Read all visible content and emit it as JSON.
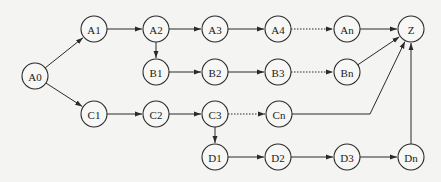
{
  "diagram": {
    "type": "directed-graph",
    "node_radius": 13,
    "colors": {
      "stroke": "#2a2a2a",
      "fill": "#f7f7f5",
      "background": "#f4f4f2"
    },
    "nodes": [
      {
        "id": "A0",
        "label": "A0",
        "x": 35,
        "y": 76
      },
      {
        "id": "A1",
        "label": "A1",
        "x": 94,
        "y": 29
      },
      {
        "id": "A2",
        "label": "A2",
        "x": 156,
        "y": 29
      },
      {
        "id": "A3",
        "label": "A3",
        "x": 215,
        "y": 29
      },
      {
        "id": "A4",
        "label": "A4",
        "x": 278,
        "y": 29
      },
      {
        "id": "An",
        "label": "An",
        "x": 347,
        "y": 29
      },
      {
        "id": "Z",
        "label": "Z",
        "x": 411,
        "y": 29
      },
      {
        "id": "B1",
        "label": "B1",
        "x": 156,
        "y": 72
      },
      {
        "id": "B2",
        "label": "B2",
        "x": 215,
        "y": 72
      },
      {
        "id": "B3",
        "label": "B3",
        "x": 278,
        "y": 72
      },
      {
        "id": "Bn",
        "label": "Bn",
        "x": 347,
        "y": 72
      },
      {
        "id": "C1",
        "label": "C1",
        "x": 94,
        "y": 114
      },
      {
        "id": "C2",
        "label": "C2",
        "x": 156,
        "y": 114
      },
      {
        "id": "C3",
        "label": "C3",
        "x": 215,
        "y": 114
      },
      {
        "id": "Cn",
        "label": "Cn",
        "x": 279,
        "y": 114
      },
      {
        "id": "D1",
        "label": "D1",
        "x": 215,
        "y": 157
      },
      {
        "id": "D2",
        "label": "D2",
        "x": 278,
        "y": 157
      },
      {
        "id": "D3",
        "label": "D3",
        "x": 347,
        "y": 157
      },
      {
        "id": "Dn",
        "label": "Dn",
        "x": 411,
        "y": 157
      }
    ],
    "edges": [
      {
        "from": "A0",
        "to": "A1",
        "style": "solid"
      },
      {
        "from": "A0",
        "to": "C1",
        "style": "solid"
      },
      {
        "from": "A1",
        "to": "A2",
        "style": "solid"
      },
      {
        "from": "A2",
        "to": "A3",
        "style": "solid"
      },
      {
        "from": "A2",
        "to": "B1",
        "style": "solid"
      },
      {
        "from": "A3",
        "to": "A4",
        "style": "solid"
      },
      {
        "from": "A4",
        "to": "An",
        "style": "dotted"
      },
      {
        "from": "An",
        "to": "Z",
        "style": "solid"
      },
      {
        "from": "B1",
        "to": "B2",
        "style": "solid"
      },
      {
        "from": "B2",
        "to": "B3",
        "style": "solid"
      },
      {
        "from": "B3",
        "to": "Bn",
        "style": "dotted"
      },
      {
        "from": "Bn",
        "to": "Z",
        "style": "solid"
      },
      {
        "from": "C1",
        "to": "C2",
        "style": "solid"
      },
      {
        "from": "C2",
        "to": "C3",
        "style": "solid"
      },
      {
        "from": "C3",
        "to": "Cn",
        "style": "dotted"
      },
      {
        "from": "C3",
        "to": "D1",
        "style": "solid"
      },
      {
        "from": "Cn",
        "to": "Z",
        "style": "solid",
        "via": [
          [
            370,
            114
          ]
        ]
      },
      {
        "from": "D1",
        "to": "D2",
        "style": "solid"
      },
      {
        "from": "D2",
        "to": "D3",
        "style": "solid"
      },
      {
        "from": "D3",
        "to": "Dn",
        "style": "solid"
      },
      {
        "from": "Dn",
        "to": "Z",
        "style": "solid"
      }
    ]
  }
}
